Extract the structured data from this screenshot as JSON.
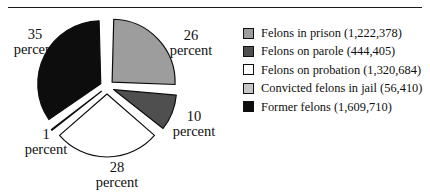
{
  "figure": {
    "has_top_rule": true,
    "has_bottom_rule": true,
    "rule_color": "#1a1a1a",
    "background": "#ffffff"
  },
  "chart_data": {
    "type": "pie",
    "title": "",
    "subtitle": "",
    "xlabel": "",
    "ylabel": "",
    "grid": false,
    "legend_position": "right",
    "exploded": true,
    "start_angle_deg": 0,
    "direction": "clockwise",
    "categories": [
      "Felons in prison",
      "Felons on parole",
      "Felons on probation",
      "Convicted felons in jail",
      "Former felons"
    ],
    "values": [
      26,
      10,
      28,
      1,
      35
    ],
    "counts": [
      1222378,
      444405,
      1320684,
      56410,
      1609710
    ],
    "colors": [
      "#9d9d9d",
      "#4f4f4f",
      "#ffffff",
      "#c6c6c6",
      "#0d0d0d"
    ],
    "slices": [
      {
        "label": "Felons in prison",
        "percent": 26,
        "percent_text": "26",
        "unit_text": "percent",
        "count": 1222378,
        "count_text": "1,222,378",
        "color": "#9d9d9d"
      },
      {
        "label": "Felons on parole",
        "percent": 10,
        "percent_text": "10",
        "unit_text": "percent",
        "count": 444405,
        "count_text": "444,405",
        "color": "#4f4f4f"
      },
      {
        "label": "Felons on probation",
        "percent": 28,
        "percent_text": "28",
        "unit_text": "percent",
        "count": 1320684,
        "count_text": "1,320,684",
        "color": "#ffffff"
      },
      {
        "label": "Convicted felons in jail",
        "percent": 1,
        "percent_text": "1",
        "unit_text": "percent",
        "count": 56410,
        "count_text": "56,410",
        "color": "#c6c6c6"
      },
      {
        "label": "Former felons",
        "percent": 35,
        "percent_text": "35",
        "unit_text": "percent",
        "count": 1609710,
        "count_text": "1,609,710",
        "color": "#0d0d0d"
      }
    ]
  },
  "legend": {
    "items": [
      {
        "swatch_color": "#9d9d9d",
        "label": "Felons in prison (1,222,378)"
      },
      {
        "swatch_color": "#4f4f4f",
        "label": "Felons on parole (444,405)"
      },
      {
        "swatch_color": "#ffffff",
        "label": "Felons on probation (1,320,684)"
      },
      {
        "swatch_color": "#c6c6c6",
        "label": "Convicted felons in jail (56,410)"
      },
      {
        "swatch_color": "#0d0d0d",
        "label": "Former felons (1,609,710)"
      }
    ]
  },
  "pie_labels": {
    "prison": {
      "num": "26",
      "word": "percent"
    },
    "parole": {
      "num": "10",
      "word": "percent"
    },
    "probation": {
      "num": "28",
      "word": "percent"
    },
    "jail": {
      "num": "1",
      "word": "percent"
    },
    "former": {
      "num": "35",
      "word": "percent"
    }
  }
}
